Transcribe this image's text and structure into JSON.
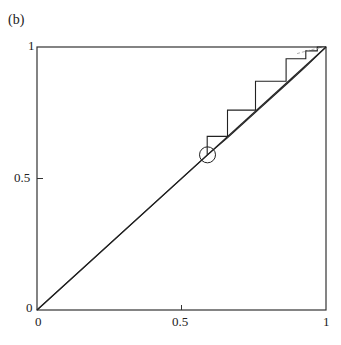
{
  "panel_label": "(b)",
  "chart_data": {
    "type": "line",
    "title": "",
    "panel": "(b)",
    "xlabel": "",
    "ylabel": "",
    "xlim": [
      0,
      1
    ],
    "ylim": [
      0,
      1
    ],
    "grid": false,
    "x_ticks": [
      "0",
      "0.5",
      "1"
    ],
    "y_ticks": [
      "0",
      "0.5",
      "1"
    ],
    "series": [
      {
        "name": "diagonal",
        "x": [
          0,
          1
        ],
        "y": [
          0,
          1
        ],
        "style": "solid"
      },
      {
        "name": "map",
        "x": [
          0,
          0.59,
          0.66,
          0.76,
          0.87,
          0.93,
          1.0
        ],
        "y": [
          0,
          0.59,
          0.655,
          0.755,
          0.865,
          0.925,
          1.0
        ],
        "style": "solid"
      },
      {
        "name": "staircase",
        "x": [
          0.589,
          0.589,
          0.659,
          0.659,
          0.756,
          0.756,
          0.862,
          0.862,
          0.93,
          0.93,
          0.97,
          0.97,
          1.0
        ],
        "y": [
          0.59,
          0.66,
          0.66,
          0.76,
          0.76,
          0.87,
          0.87,
          0.955,
          0.955,
          0.985,
          0.985,
          1.0,
          1.0
        ],
        "style": "solid"
      },
      {
        "name": "dashed-curve",
        "x": [
          0.9,
          0.95,
          1.0
        ],
        "y": [
          0.975,
          0.99,
          1.0
        ],
        "style": "dashed"
      }
    ],
    "annotations": [
      {
        "type": "circle",
        "x": 0.59,
        "y": 0.59,
        "label": ""
      }
    ]
  }
}
